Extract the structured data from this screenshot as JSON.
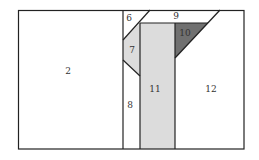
{
  "diagram": {
    "colors": {
      "stroke": "#222222",
      "light_fill": "#dcdcdc",
      "dark_fill": "#707070",
      "background": "#ffffff"
    },
    "regions": [
      {
        "id": "2",
        "label": "2",
        "fill": "none"
      },
      {
        "id": "6",
        "label": "6",
        "fill": "none"
      },
      {
        "id": "7",
        "label": "7",
        "fill": "light"
      },
      {
        "id": "8",
        "label": "8",
        "fill": "none"
      },
      {
        "id": "9",
        "label": "9",
        "fill": "none"
      },
      {
        "id": "10",
        "label": "10",
        "fill": "dark"
      },
      {
        "id": "11",
        "label": "11",
        "fill": "light"
      },
      {
        "id": "12",
        "label": "12",
        "fill": "none"
      }
    ]
  }
}
